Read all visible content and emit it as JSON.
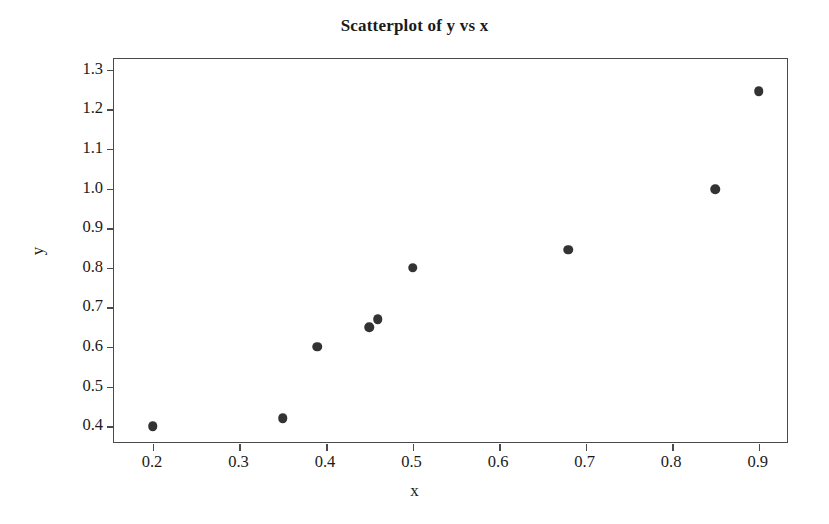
{
  "chart_data": {
    "type": "scatter",
    "title": "Scatterplot of y vs x",
    "xlabel": "x",
    "ylabel": "y",
    "xlim": [
      0.155,
      0.935
    ],
    "ylim": [
      0.355,
      1.327
    ],
    "grid": false,
    "legend": null,
    "xticks": [
      "0.2",
      "0.3",
      "0.4",
      "0.5",
      "0.6",
      "0.7",
      "0.8",
      "0.9"
    ],
    "xtick_values": [
      0.2,
      0.3,
      0.4,
      0.5,
      0.6,
      0.7,
      0.8,
      0.9
    ],
    "yticks": [
      "0.4",
      "0.5",
      "0.6",
      "0.7",
      "0.8",
      "0.9",
      "1.0",
      "1.1",
      "1.2",
      "1.3"
    ],
    "ytick_values": [
      0.4,
      0.5,
      0.6,
      0.7,
      0.8,
      0.9,
      1.0,
      1.1,
      1.2,
      1.3
    ],
    "marker_color": "#333333",
    "frame_color": "#4a4a4a",
    "x": [
      0.2,
      0.35,
      0.39,
      0.45,
      0.46,
      0.5,
      0.68,
      0.85,
      0.9
    ],
    "y": [
      0.4,
      0.42,
      0.6,
      0.65,
      0.67,
      0.8,
      0.845,
      0.998,
      1.245
    ],
    "points": [
      {
        "x": 0.2,
        "y": 0.4
      },
      {
        "x": 0.35,
        "y": 0.42
      },
      {
        "x": 0.39,
        "y": 0.6
      },
      {
        "x": 0.45,
        "y": 0.65
      },
      {
        "x": 0.46,
        "y": 0.67
      },
      {
        "x": 0.5,
        "y": 0.8
      },
      {
        "x": 0.68,
        "y": 0.845
      },
      {
        "x": 0.85,
        "y": 0.998
      },
      {
        "x": 0.9,
        "y": 1.245
      }
    ]
  }
}
